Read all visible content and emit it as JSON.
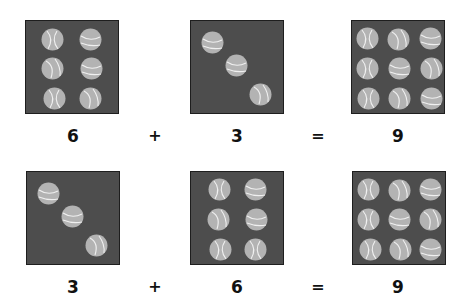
{
  "colors": {
    "box_fill": "#4d4d4d",
    "box_border": "#1e1e1e",
    "ball_fill": "#b3b3b3",
    "ball_seam": "#f0f0f0",
    "text": "#111111"
  },
  "rows": [
    {
      "equation": {
        "a": "6",
        "plus": "+",
        "b": "3",
        "equals": "=",
        "sum": "9"
      },
      "boxes": [
        {
          "count": 6,
          "left": 25,
          "top": 20,
          "balls": [
            [
              26,
              18,
              0
            ],
            [
              64,
              18,
              1
            ],
            [
              26,
              47,
              2
            ],
            [
              65,
              47,
              1
            ],
            [
              28,
              77,
              0
            ],
            [
              64,
              77,
              2
            ]
          ]
        },
        {
          "count": 3,
          "left": 190,
          "top": 20,
          "balls": [
            [
              21,
              21,
              1
            ],
            [
              45,
              44,
              1
            ],
            [
              69,
              73,
              2
            ]
          ]
        },
        {
          "count": 9,
          "left": 351,
          "top": 20,
          "balls": [
            [
              15,
              17,
              0
            ],
            [
              46,
              18,
              2
            ],
            [
              78,
              17,
              1
            ],
            [
              15,
              47,
              0
            ],
            [
              47,
              47,
              1
            ],
            [
              79,
              47,
              2
            ],
            [
              16,
              77,
              0
            ],
            [
              47,
              77,
              2
            ],
            [
              79,
              77,
              1
            ]
          ]
        }
      ]
    },
    {
      "equation": {
        "a": "3",
        "plus": "+",
        "b": "6",
        "equals": "=",
        "sum": "9"
      },
      "boxes": [
        {
          "count": 3,
          "left": 26,
          "top": 171,
          "balls": [
            [
              21,
              21,
              1
            ],
            [
              45,
              44,
              1
            ],
            [
              69,
              73,
              2
            ]
          ]
        },
        {
          "count": 6,
          "left": 190,
          "top": 171,
          "balls": [
            [
              28,
              17,
              0
            ],
            [
              64,
              17,
              1
            ],
            [
              27,
              47,
              2
            ],
            [
              65,
              47,
              1
            ],
            [
              29,
              77,
              0
            ],
            [
              64,
              77,
              0
            ]
          ]
        },
        {
          "count": 9,
          "left": 352,
          "top": 171,
          "balls": [
            [
              15,
              17,
              0
            ],
            [
              46,
              18,
              2
            ],
            [
              77,
              17,
              1
            ],
            [
              15,
              47,
              0
            ],
            [
              46,
              47,
              1
            ],
            [
              77,
              47,
              2
            ],
            [
              17,
              77,
              0
            ],
            [
              47,
              77,
              2
            ],
            [
              77,
              77,
              1
            ]
          ]
        }
      ]
    }
  ]
}
